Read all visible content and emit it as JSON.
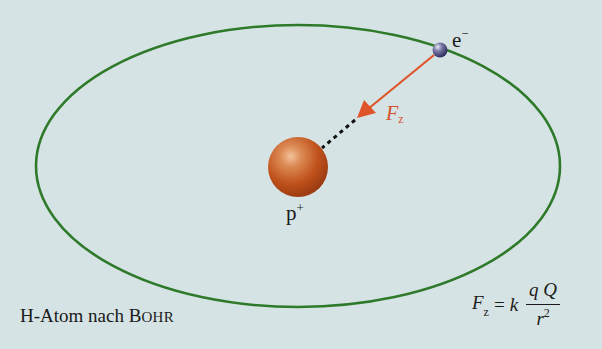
{
  "figure": {
    "title": "H-Atom nach Bohr",
    "caption": {
      "prefix": "H-Atom nach ",
      "name_first_letter": "B",
      "name_rest": "OHR"
    },
    "background_color": "#d6e3e4"
  },
  "orbit": {
    "shape": "ellipse",
    "color": "#2e7a2a",
    "center": [
      298,
      166
    ],
    "rx": 262,
    "ry": 141
  },
  "electron": {
    "label": "e",
    "charge_sign": "−",
    "color": "#4a4a8a",
    "position": [
      440,
      50
    ]
  },
  "proton": {
    "label": "p",
    "charge_sign": "+",
    "color": "#c0521c",
    "position": [
      298,
      167
    ]
  },
  "force_arrow": {
    "label": "F",
    "subscript": "z",
    "color": "#e0542a",
    "from": [
      440,
      50
    ],
    "to": [
      357,
      118
    ]
  },
  "formula": {
    "lhs": "F",
    "lhs_subscript": "z",
    "equals": "=",
    "constant": "k",
    "numerator": "q Q",
    "denominator": "r",
    "denominator_exponent": "2"
  }
}
